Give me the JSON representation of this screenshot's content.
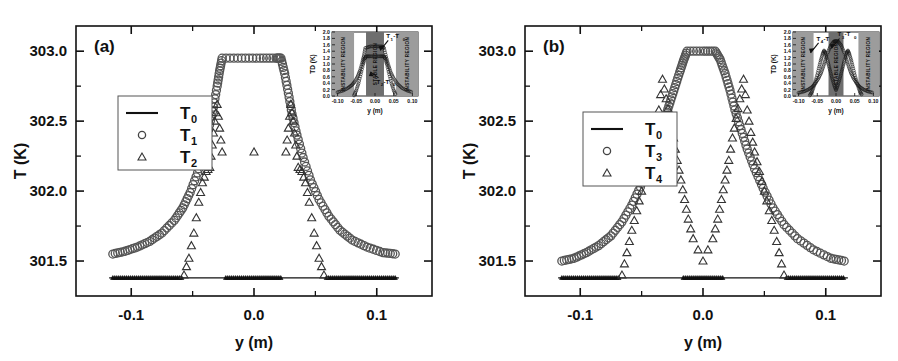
{
  "figure": {
    "background": "#ffffff",
    "panels": [
      "a",
      "b"
    ]
  },
  "chart_data": [
    {
      "id": "panel-a",
      "type": "scatter",
      "panel_label": "(a)",
      "title": "",
      "xlabel": "y (m)",
      "ylabel": "T (K)",
      "xlim": [
        -0.145,
        0.145
      ],
      "ylim": [
        301.25,
        303.18
      ],
      "xticks": [
        -0.1,
        0.0,
        0.1
      ],
      "xticklabels": [
        "-0.1",
        "0.0",
        "0.1"
      ],
      "xminorticks": [
        -0.05,
        0.05
      ],
      "yticks": [
        301.5,
        302.0,
        302.5,
        303.0
      ],
      "yticklabels": [
        "301.5",
        "302.0",
        "302.5",
        "303.0"
      ],
      "yminorticks": [
        301.75,
        302.25,
        302.75
      ],
      "grid": false,
      "legend_position": "left-upper",
      "series": [
        {
          "name": "T0",
          "label": "T",
          "sub": "0",
          "marker": "line",
          "color": "#111111",
          "description": "flat baseline at 301.38 K with dense triangle markers over three segments",
          "baseline_value": 301.38,
          "x": [
            -0.115,
            0.115
          ],
          "values": [
            301.38,
            301.38
          ]
        },
        {
          "name": "T1",
          "label": "T",
          "sub": "1",
          "marker": "circle",
          "color": "#555555",
          "description": "broad bell with flat top plateau at 302.95 K between y = -0.026 and y = 0.022, tails decaying to 301.55 K",
          "plateau_value": 302.95,
          "plateau_range": [
            -0.026,
            0.022
          ],
          "tail_value": 301.55,
          "x": [
            -0.115,
            -0.105,
            -0.095,
            -0.085,
            -0.075,
            -0.065,
            -0.058,
            -0.052,
            -0.046,
            -0.041,
            -0.037,
            -0.033,
            -0.03,
            -0.028,
            -0.026,
            -0.01,
            0.005,
            0.018,
            0.022,
            0.025,
            0.028,
            0.031,
            0.035,
            0.04,
            0.046,
            0.053,
            0.061,
            0.07,
            0.08,
            0.092,
            0.105,
            0.115
          ],
          "values": [
            301.55,
            301.57,
            301.6,
            301.64,
            301.7,
            301.79,
            301.88,
            301.99,
            302.13,
            302.28,
            302.44,
            302.6,
            302.75,
            302.86,
            302.95,
            302.95,
            302.95,
            302.95,
            302.95,
            302.84,
            302.7,
            302.55,
            302.4,
            302.24,
            302.08,
            301.94,
            301.82,
            301.72,
            301.65,
            301.6,
            301.56,
            301.55
          ]
        },
        {
          "name": "T2",
          "label": "T",
          "sub": "2",
          "marker": "triangle",
          "color": "#333333",
          "description": "narrow twin-shouldered profile rising from baseline at |y| = 0.057 to ~302.62 K near |y| = 0.032, dropping into central gap",
          "x": [
            -0.057,
            -0.053,
            -0.049,
            -0.045,
            -0.042,
            -0.039,
            -0.036,
            -0.034,
            -0.032,
            -0.03,
            -0.028,
            -0.026,
            0.026,
            0.028,
            0.03,
            0.032,
            0.034,
            0.036,
            0.039,
            0.042,
            0.045,
            0.049,
            0.053,
            0.057
          ],
          "values": [
            301.4,
            301.52,
            301.7,
            301.92,
            302.06,
            302.14,
            302.17,
            302.33,
            302.5,
            302.62,
            302.45,
            302.28,
            302.28,
            302.45,
            302.62,
            302.5,
            302.33,
            302.17,
            302.14,
            302.06,
            301.92,
            301.7,
            301.52,
            301.4
          ]
        }
      ],
      "inset": {
        "xlabel": "y (m)",
        "ylabel": "TD (K)",
        "xlim": [
          -0.115,
          0.115
        ],
        "ylim": [
          0.0,
          2.0
        ],
        "xticks": [
          -0.1,
          -0.05,
          0.0,
          0.05,
          0.1
        ],
        "xticklabels": [
          "-0.10",
          "-0.05",
          "0.00",
          "0.05",
          "0.10"
        ],
        "yticks": [
          0.0,
          0.2,
          0.4,
          0.6,
          0.8,
          1.0,
          1.2,
          1.4,
          1.6,
          1.8,
          2.0
        ],
        "yticklabels": [
          "0.0",
          "0.2",
          "0.4",
          "0.6",
          "0.8",
          "1.0",
          "1.2",
          "1.4",
          "1.6",
          "1.8",
          "2.0"
        ],
        "regions": [
          {
            "name": "instability-left",
            "label": "INSTABILITY REGION",
            "x0": -0.115,
            "x1": -0.056,
            "shade": "#9c9c9c"
          },
          {
            "name": "stable-center",
            "label": "STABLE REGION",
            "x0": -0.024,
            "x1": 0.024,
            "shade": "#6e6e6e"
          },
          {
            "name": "instability-right",
            "label": "INSTABILITY REGION",
            "x0": 0.056,
            "x1": 0.115,
            "shade": "#9c9c9c"
          }
        ],
        "annotations": [
          {
            "name": "t1-t0",
            "label": "T",
            "sub": "1",
            "tail": "-T",
            "tail_sub": "0",
            "x": 0.03,
            "y": 1.8
          },
          {
            "name": "t2-t0",
            "label": "T",
            "sub": "2",
            "tail": "-T",
            "tail_sub": "0",
            "x": 0.004,
            "y": 0.38
          }
        ],
        "series": [
          {
            "name": "T1-T0",
            "marker": "circle",
            "x": [
              -0.1,
              -0.085,
              -0.072,
              -0.062,
              -0.054,
              -0.046,
              -0.04,
              -0.034,
              -0.03,
              -0.026,
              -0.012,
              0.004,
              0.018,
              0.024,
              0.03,
              0.036,
              0.042,
              0.05,
              0.06,
              0.072,
              0.086,
              0.1
            ],
            "values": [
              0.12,
              0.17,
              0.25,
              0.34,
              0.45,
              0.62,
              0.8,
              1.05,
              1.25,
              1.5,
              1.55,
              1.55,
              1.55,
              1.5,
              1.22,
              0.96,
              0.74,
              0.55,
              0.38,
              0.25,
              0.17,
              0.12
            ]
          },
          {
            "name": "T2-T0",
            "marker": "circle",
            "x": [
              -0.056,
              -0.05,
              -0.044,
              -0.038,
              -0.032,
              -0.028,
              -0.024,
              -0.014,
              0.0,
              0.014,
              0.024,
              0.028,
              0.032,
              0.038,
              0.044,
              0.05,
              0.056
            ],
            "values": [
              0.02,
              0.18,
              0.4,
              0.68,
              0.98,
              1.16,
              1.24,
              1.24,
              1.24,
              1.24,
              1.24,
              1.16,
              0.98,
              0.68,
              0.4,
              0.18,
              0.02
            ]
          }
        ]
      }
    },
    {
      "id": "panel-b",
      "type": "scatter",
      "panel_label": "(b)",
      "title": "",
      "xlabel": "y (m)",
      "ylabel": "T (K)",
      "xlim": [
        -0.145,
        0.145
      ],
      "ylim": [
        301.25,
        303.18
      ],
      "xticks": [
        -0.1,
        0.0,
        0.1
      ],
      "xticklabels": [
        "-0.1",
        "0.0",
        "0.1"
      ],
      "xminorticks": [
        -0.05,
        0.05
      ],
      "yticks": [
        301.5,
        302.0,
        302.5,
        303.0
      ],
      "yticklabels": [
        "301.5",
        "302.0",
        "302.5",
        "303.0"
      ],
      "yminorticks": [
        301.75,
        302.25,
        302.75
      ],
      "grid": false,
      "legend_position": "left-upper",
      "series": [
        {
          "name": "T0",
          "label": "T",
          "sub": "0",
          "marker": "line",
          "color": "#111111",
          "description": "flat baseline at 301.38 K with dense triangle markers over three segments",
          "baseline_value": 301.38,
          "x": [
            -0.115,
            0.115
          ],
          "values": [
            301.38,
            301.38
          ]
        },
        {
          "name": "T3",
          "label": "T",
          "sub": "3",
          "marker": "circle",
          "color": "#555555",
          "description": "broad bell with narrow flat top plateau at 303.0 K between y = -0.013 and y = 0.010, tails decaying to 301.50 K",
          "plateau_value": 303.0,
          "plateau_range": [
            -0.013,
            0.01
          ],
          "tail_value": 301.5,
          "x": [
            -0.115,
            -0.105,
            -0.095,
            -0.085,
            -0.075,
            -0.066,
            -0.058,
            -0.051,
            -0.045,
            -0.04,
            -0.035,
            -0.031,
            -0.027,
            -0.023,
            -0.019,
            -0.016,
            -0.013,
            0.0,
            0.01,
            0.014,
            0.018,
            0.022,
            0.026,
            0.031,
            0.036,
            0.042,
            0.049,
            0.057,
            0.066,
            0.077,
            0.09,
            0.104,
            0.115
          ],
          "values": [
            301.5,
            301.52,
            301.56,
            301.61,
            301.68,
            301.78,
            301.9,
            302.03,
            302.16,
            302.28,
            302.4,
            302.52,
            302.63,
            302.74,
            302.85,
            302.93,
            303.0,
            303.0,
            303.0,
            302.94,
            302.84,
            302.72,
            302.58,
            302.44,
            302.3,
            302.16,
            302.02,
            301.88,
            301.76,
            301.66,
            301.58,
            301.52,
            301.5
          ]
        },
        {
          "name": "T4",
          "label": "T",
          "sub": "4",
          "marker": "triangle",
          "color": "#333333",
          "description": "double-peaked profile with maxima ~302.80 K at |y| = 0.033 and a deep central dip to 301.50 K at y = 0",
          "peak_value": 302.8,
          "peak_positions": [
            -0.033,
            0.033
          ],
          "dip_value": 301.5,
          "x": [
            -0.066,
            -0.062,
            -0.058,
            -0.054,
            -0.05,
            -0.046,
            -0.042,
            -0.039,
            -0.036,
            -0.033,
            -0.03,
            -0.027,
            -0.024,
            -0.021,
            -0.018,
            -0.015,
            -0.012,
            -0.008,
            0.0,
            0.008,
            0.012,
            0.015,
            0.018,
            0.021,
            0.024,
            0.027,
            0.03,
            0.033,
            0.036,
            0.039,
            0.042,
            0.046,
            0.05,
            0.054,
            0.058,
            0.062,
            0.066
          ],
          "values": [
            301.4,
            301.56,
            301.72,
            301.86,
            302.0,
            302.14,
            302.28,
            302.42,
            302.58,
            302.8,
            302.66,
            302.52,
            302.38,
            302.22,
            302.08,
            301.94,
            301.8,
            301.66,
            301.5,
            301.66,
            301.8,
            301.94,
            302.08,
            302.22,
            302.38,
            302.52,
            302.66,
            302.8,
            302.58,
            302.42,
            302.28,
            302.14,
            302.0,
            301.86,
            301.72,
            301.56,
            301.4
          ]
        }
      ],
      "inset": {
        "xlabel": "y (m)",
        "ylabel": "TD (K)",
        "xlim": [
          -0.115,
          0.115
        ],
        "ylim": [
          0.0,
          2.0
        ],
        "xticks": [
          -0.1,
          -0.05,
          0.0,
          0.05,
          0.1
        ],
        "xticklabels": [
          "-0.10",
          "-0.05",
          "0.00",
          "0.05",
          "0.10"
        ],
        "yticks": [
          0.0,
          0.2,
          0.4,
          0.6,
          0.8,
          1.0,
          1.2,
          1.4,
          1.6,
          1.8,
          2.0
        ],
        "yticklabels": [
          "0.0",
          "0.2",
          "0.4",
          "0.6",
          "0.8",
          "1.0",
          "1.2",
          "1.4",
          "1.6",
          "1.8",
          "2.0"
        ],
        "regions": [
          {
            "name": "instability-left",
            "label": "INSTABILITY REGION",
            "x0": -0.115,
            "x1": -0.06,
            "shade": "#9c9c9c"
          },
          {
            "name": "stable-center",
            "label": "STABLE REGION",
            "x0": -0.02,
            "x1": 0.02,
            "shade": "#6e6e6e"
          },
          {
            "name": "instability-right",
            "label": "INSTABILITY REGION",
            "x0": 0.06,
            "x1": 0.115,
            "shade": "#9c9c9c"
          }
        ],
        "annotations": [
          {
            "name": "t4-t0",
            "label": "T",
            "sub": "4",
            "tail": "-T",
            "tail_sub": "0",
            "x": -0.052,
            "y": 1.72
          },
          {
            "name": "t3-t0",
            "label": "T",
            "sub": "3",
            "tail": "-T",
            "tail_sub": "0",
            "x": 0.004,
            "y": 1.86
          }
        ],
        "series": [
          {
            "name": "T3-T0",
            "marker": "circle",
            "x": [
              -0.1,
              -0.086,
              -0.074,
              -0.064,
              -0.055,
              -0.047,
              -0.04,
              -0.034,
              -0.028,
              -0.022,
              -0.014,
              -0.006,
              0.0,
              0.006,
              0.014,
              0.022,
              0.028,
              0.034,
              0.04,
              0.047,
              0.055,
              0.064,
              0.074,
              0.086,
              0.1
            ],
            "values": [
              0.1,
              0.14,
              0.2,
              0.28,
              0.4,
              0.55,
              0.72,
              0.92,
              1.14,
              1.36,
              1.58,
              1.7,
              1.72,
              1.7,
              1.58,
              1.36,
              1.14,
              0.92,
              0.72,
              0.55,
              0.4,
              0.28,
              0.2,
              0.14,
              0.1
            ]
          },
          {
            "name": "T4-T0",
            "marker": "circle",
            "x": [
              -0.07,
              -0.064,
              -0.058,
              -0.052,
              -0.046,
              -0.041,
              -0.036,
              -0.032,
              -0.028,
              -0.024,
              -0.02,
              -0.015,
              -0.01,
              -0.005,
              0.0,
              0.005,
              0.01,
              0.015,
              0.02,
              0.024,
              0.028,
              0.032,
              0.036,
              0.041,
              0.046,
              0.052,
              0.058,
              0.064,
              0.07
            ],
            "values": [
              0.02,
              0.14,
              0.34,
              0.58,
              0.86,
              1.1,
              1.3,
              1.42,
              1.34,
              1.18,
              0.98,
              0.76,
              0.54,
              0.34,
              0.18,
              0.34,
              0.54,
              0.76,
              0.98,
              1.18,
              1.34,
              1.42,
              1.3,
              1.1,
              0.86,
              0.58,
              0.34,
              0.14,
              0.02
            ]
          }
        ]
      }
    }
  ]
}
